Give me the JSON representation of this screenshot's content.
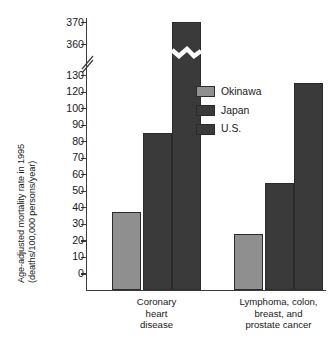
{
  "chart_data": {
    "type": "bar",
    "title": "",
    "subtitle": "",
    "xlabel": "",
    "ylabel": "Age-adjusted mortality rate in 1995 (deaths/100,000 persons/year)",
    "ylabel_lines": [
      "Age-adjusted mortality rate in 1995",
      "(deaths/100,000 persons/year)"
    ],
    "categories": [
      "Coronary heart disease",
      "Lymphoma, colon, breast, and prostate cancer"
    ],
    "category_label_lines": [
      [
        "Coronary",
        "heart",
        "disease"
      ],
      [
        "Lymphoma, colon,",
        "breast, and",
        "prostate cancer"
      ]
    ],
    "series": [
      {
        "name": "Okinawa",
        "color": "#8f8f8f",
        "values": [
          47,
          34
        ]
      },
      {
        "name": "Japan",
        "color": "#3a3a3a",
        "values": [
          95,
          65
        ]
      },
      {
        "name": "U.S.",
        "color": "#3a3a3a",
        "values": [
          370,
          125
        ]
      }
    ],
    "ylim": [
      0,
      370
    ],
    "axis_break": {
      "from": 130,
      "to": 360,
      "marker": "diagonal-slash"
    },
    "bar_break_marker": "zigzag",
    "broken_bar": {
      "series": "U.S.",
      "category": "Coronary heart disease",
      "value": 370
    },
    "grid": false,
    "legend_position": "center-right",
    "yticks": [
      0,
      10,
      20,
      30,
      40,
      50,
      60,
      70,
      80,
      90,
      100,
      120,
      130,
      360,
      370
    ],
    "ytick_labels": [
      "0",
      "10",
      "20",
      "30",
      "40",
      "50",
      "60",
      "70",
      "80",
      "90",
      "100",
      "120",
      "130",
      "360",
      "370"
    ]
  },
  "axis": {
    "ticks": [
      {
        "label": "370",
        "value": 370
      },
      {
        "label": "360",
        "value": 360
      },
      {
        "label": "130",
        "value": 130
      },
      {
        "label": "120",
        "value": 120
      },
      {
        "label": "100",
        "value": 110
      },
      {
        "label": "90",
        "value": 100
      },
      {
        "label": "80",
        "value": 90
      },
      {
        "label": "70",
        "value": 80
      },
      {
        "label": "60",
        "value": 70
      },
      {
        "label": "50",
        "value": 60
      },
      {
        "label": "40",
        "value": 50
      },
      {
        "label": "30",
        "value": 40
      },
      {
        "label": "20",
        "value": 30
      },
      {
        "label": "10",
        "value": 20
      },
      {
        "label": "0",
        "value": 10
      }
    ]
  },
  "legend": {
    "items": [
      {
        "label": "Okinawa",
        "color": "#8f8f8f"
      },
      {
        "label": "Japan",
        "color": "#3a3a3a"
      },
      {
        "label": "U.S.",
        "color": "#3a3a3a"
      }
    ]
  },
  "colors": {
    "okinawa": "#8f8f8f",
    "japan": "#3a3a3a",
    "us": "#3a3a3a",
    "axis": "#3b3b3b",
    "background": "#ffffff",
    "text": "#1a1a1a"
  }
}
